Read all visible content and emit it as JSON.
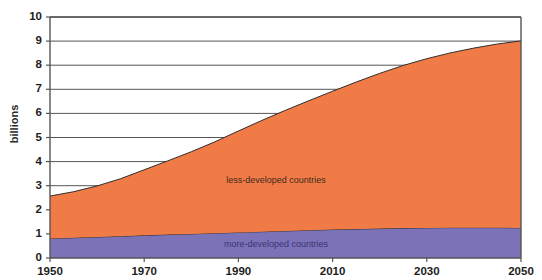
{
  "chart_data": {
    "type": "area",
    "stacked": true,
    "title": "",
    "xlabel": "",
    "ylabel": "billions",
    "xlim": [
      1950,
      2050
    ],
    "ylim": [
      0,
      10
    ],
    "grid": true,
    "grid_axis": "y",
    "legend_position": "inline-annotation",
    "y_ticks": [
      0,
      1,
      2,
      3,
      4,
      5,
      6,
      7,
      8,
      9,
      10
    ],
    "y_tick_labels": [
      "0",
      "1",
      "2",
      "3",
      "4",
      "5",
      "6",
      "7",
      "8",
      "9",
      "10"
    ],
    "x_ticks": [
      1950,
      1970,
      1990,
      2010,
      2030,
      2050
    ],
    "x_tick_labels": [
      "1950",
      "1970",
      "1990",
      "2010",
      "2030",
      "2050"
    ],
    "x": [
      1950,
      1955,
      1960,
      1965,
      1970,
      1975,
      1980,
      1985,
      1990,
      1995,
      2000,
      2005,
      2010,
      2015,
      2020,
      2025,
      2030,
      2035,
      2040,
      2045,
      2050
    ],
    "series": [
      {
        "name": "more-developed countries",
        "label": "more-developed countries",
        "color": "#7b72b8",
        "label_color": "#3c3570",
        "values": [
          0.81,
          0.84,
          0.87,
          0.9,
          0.94,
          0.97,
          1.0,
          1.03,
          1.06,
          1.09,
          1.12,
          1.15,
          1.18,
          1.2,
          1.22,
          1.24,
          1.25,
          1.26,
          1.26,
          1.26,
          1.25
        ]
      },
      {
        "name": "less-developed countries",
        "label": "less-developed countries",
        "color": "#f07b46",
        "label_color": "#3d2a20",
        "values": [
          1.76,
          1.91,
          2.12,
          2.39,
          2.72,
          3.06,
          3.41,
          3.79,
          4.21,
          4.62,
          5.01,
          5.38,
          5.74,
          6.1,
          6.44,
          6.75,
          7.02,
          7.25,
          7.45,
          7.62,
          7.76
        ]
      }
    ],
    "totals": [
      2.57,
      2.75,
      2.99,
      3.29,
      3.66,
      4.03,
      4.41,
      4.82,
      5.27,
      5.71,
      6.13,
      6.53,
      6.92,
      7.3,
      7.66,
      7.99,
      8.27,
      8.51,
      8.71,
      8.88,
      9.01
    ],
    "annotations": [
      {
        "text": "less-developed countries",
        "x": 1998,
        "y": 3.1
      },
      {
        "text": "more-developed countries",
        "x": 1998,
        "y": 0.45
      }
    ],
    "axis_color": "#555555",
    "grid_color": "#555555",
    "plot_bg": "#ffffff",
    "plot_area_px": {
      "left": 50,
      "right": 521,
      "top": 17,
      "bottom": 258
    }
  }
}
